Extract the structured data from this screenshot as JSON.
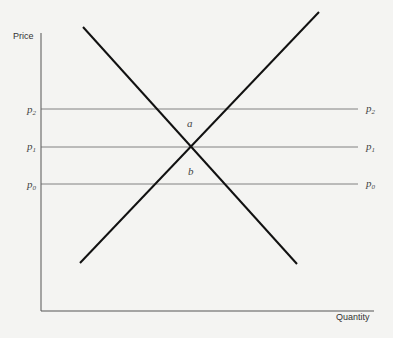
{
  "diagram": {
    "y_axis_label": "Price",
    "x_axis_label": "Quantity",
    "price_levels": [
      {
        "id": "p2",
        "symbol": "p",
        "subscript": "2"
      },
      {
        "id": "p1",
        "symbol": "p",
        "subscript": "1"
      },
      {
        "id": "p0",
        "symbol": "p",
        "subscript": "0"
      }
    ],
    "regions": [
      {
        "id": "a",
        "label": "a"
      },
      {
        "id": "b",
        "label": "b"
      }
    ],
    "curves": [
      {
        "id": "demand",
        "description": "downward sloping line"
      },
      {
        "id": "supply",
        "description": "upward sloping line"
      }
    ],
    "colors": {
      "background": "#f4f4f2",
      "curve": "#111111",
      "guide": "#666666"
    }
  }
}
